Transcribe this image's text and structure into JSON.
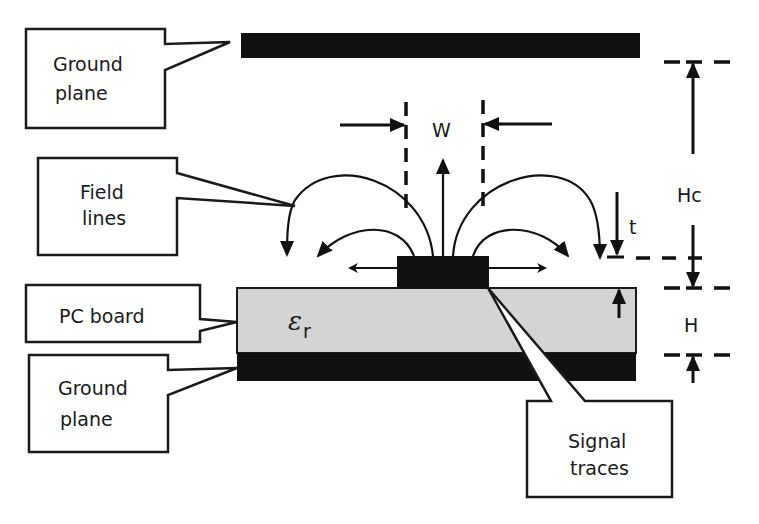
{
  "diagram": {
    "colors": {
      "conductor": "#111111",
      "board": "#d4d4d4",
      "outline": "#1a1a1a",
      "background": "#ffffff"
    },
    "callouts": {
      "ground_plane_top": {
        "line1": "Ground",
        "line2": "plane"
      },
      "field_lines": {
        "line1": "Field",
        "line2": "lines"
      },
      "pc_board": {
        "line1": "PC board"
      },
      "ground_plane_bottom": {
        "line1": "Ground",
        "line2": "plane"
      },
      "signal_traces": {
        "line1": "Signal",
        "line2": "traces"
      }
    },
    "dimensions": {
      "width_label": "W",
      "thickness_label": "t",
      "cap_height_label": "Hc",
      "board_height_label": "H"
    },
    "board": {
      "dielectric_symbol": "ε",
      "dielectric_subscript": "r"
    }
  }
}
